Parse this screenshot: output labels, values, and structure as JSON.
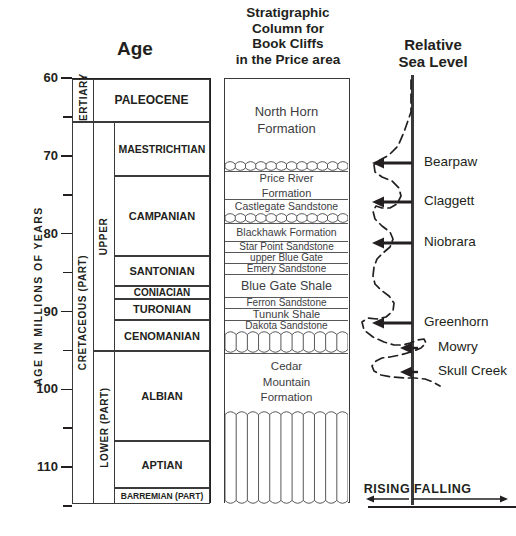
{
  "titles": {
    "age": "Age",
    "strat": [
      "Stratigraphic",
      "Column for",
      "Book Cliffs",
      "in the Price area"
    ],
    "sea": [
      "Relative",
      "Sea Level"
    ]
  },
  "axis": {
    "label": "AGE  IN  MILLIONS  OF  YEARS",
    "ticks": [
      {
        "value": "60",
        "major": true
      },
      {
        "value": "",
        "major": false
      },
      {
        "value": "70",
        "major": true
      },
      {
        "value": "",
        "major": false
      },
      {
        "value": "80",
        "major": true
      },
      {
        "value": "",
        "major": false
      },
      {
        "value": "90",
        "major": true
      },
      {
        "value": "",
        "major": false
      },
      {
        "value": "100",
        "major": true
      },
      {
        "value": "",
        "major": false
      },
      {
        "value": "110",
        "major": true
      },
      {
        "value": "",
        "major": false
      }
    ],
    "range": [
      60,
      115
    ]
  },
  "age_column": {
    "systems": [
      {
        "name": "TERTIARY",
        "top": 60,
        "bottom": 65.5
      },
      {
        "name": "CRETACEOUS  (PART)",
        "top": 65.5,
        "bottom": 114.6
      }
    ],
    "series": [
      {
        "name": "UPPER",
        "top": 65.5,
        "bottom": 95.0
      },
      {
        "name": "LOWER (PART)",
        "top": 95.0,
        "bottom": 114.6
      }
    ],
    "stages": [
      {
        "name": "PALEOCENE",
        "top": 60,
        "bottom": 65.5,
        "size": 12
      },
      {
        "name": "MAESTRICHTIAN",
        "top": 65.5,
        "bottom": 72.5,
        "size": 10.5
      },
      {
        "name": "CAMPANIAN",
        "top": 72.5,
        "bottom": 82.8,
        "size": 11
      },
      {
        "name": "SANTONIAN",
        "top": 82.8,
        "bottom": 86.6,
        "size": 11
      },
      {
        "name": "CONIACIAN",
        "top": 86.6,
        "bottom": 88.2,
        "size": 10
      },
      {
        "name": "TURONIAN",
        "top": 88.2,
        "bottom": 91.0,
        "size": 11
      },
      {
        "name": "CENOMANIAN",
        "top": 91.0,
        "bottom": 95.0,
        "size": 11
      },
      {
        "name": "ALBIAN",
        "top": 95.0,
        "bottom": 106.5,
        "size": 11
      },
      {
        "name": "APTIAN",
        "top": 106.5,
        "bottom": 112.6,
        "size": 11
      },
      {
        "name": "BARREMIAN (PART)",
        "top": 112.6,
        "bottom": 114.6,
        "size": 8.5
      }
    ]
  },
  "strat_column": {
    "units": [
      {
        "name": "North Horn Formation",
        "lines": [
          "North Horn",
          "Formation"
        ],
        "top": 78,
        "bottom": 160,
        "size": 13,
        "pattern": "plain"
      },
      {
        "name": "unconformity-1",
        "lines": [],
        "top": 160,
        "bottom": 170,
        "size": 0,
        "pattern": "wavy"
      },
      {
        "name": "Price River Formation",
        "lines": [
          "Price River",
          "Formation"
        ],
        "top": 170,
        "bottom": 198,
        "size": 11,
        "pattern": "plain"
      },
      {
        "name": "Castlegate Sandstone",
        "lines": [
          "Castlegate Sandstone"
        ],
        "top": 198,
        "bottom": 212,
        "size": 10.5,
        "pattern": "plain"
      },
      {
        "name": "unconformity-2",
        "lines": [],
        "top": 212,
        "bottom": 222,
        "size": 0,
        "pattern": "wavy"
      },
      {
        "name": "Blackhawk Formation",
        "lines": [
          "Blackhawk Formation"
        ],
        "top": 222,
        "bottom": 240,
        "size": 10.5,
        "pattern": "plain"
      },
      {
        "name": "Star Point Sandstone",
        "lines": [
          "Star Point Sandstone"
        ],
        "top": 240,
        "bottom": 251,
        "size": 10,
        "pattern": "plain"
      },
      {
        "name": "upper Blue Gate",
        "lines": [
          "upper Blue Gate"
        ],
        "top": 251,
        "bottom": 262,
        "size": 10,
        "pattern": "plain"
      },
      {
        "name": "Emery Sandstone",
        "lines": [
          "Emery Sandstone"
        ],
        "top": 262,
        "bottom": 273,
        "size": 10,
        "pattern": "plain"
      },
      {
        "name": "Blue Gate Shale",
        "lines": [
          "Blue Gate Shale"
        ],
        "top": 273,
        "bottom": 296,
        "size": 12.5,
        "pattern": "plain"
      },
      {
        "name": "Ferron Sandstone",
        "lines": [
          "Ferron Sandstone"
        ],
        "top": 296,
        "bottom": 307,
        "size": 10,
        "pattern": "plain"
      },
      {
        "name": "Tununk Shale",
        "lines": [
          "Tununk Shale"
        ],
        "top": 307,
        "bottom": 319,
        "size": 11,
        "pattern": "plain"
      },
      {
        "name": "Dakota Sandstone",
        "lines": [
          "Dakota Sandstone"
        ],
        "top": 319,
        "bottom": 330,
        "size": 10,
        "pattern": "plain"
      },
      {
        "name": "unconformity-3",
        "lines": [],
        "top": 330,
        "bottom": 352,
        "size": 0,
        "pattern": "columnar"
      },
      {
        "name": "Cedar Mountain Formation",
        "lines": [
          "Cedar",
          "Mountain",
          "Formation"
        ],
        "top": 352,
        "bottom": 410,
        "size": 11.5,
        "pattern": "plain"
      },
      {
        "name": "unconformity-4",
        "lines": [],
        "top": 410,
        "bottom": 503,
        "size": 0,
        "pattern": "columnar"
      }
    ]
  },
  "sea_level": {
    "events": [
      {
        "label": "Bearpaw",
        "y": 163
      },
      {
        "label": "Claggett",
        "y": 202
      },
      {
        "label": "Niobrara",
        "y": 243
      },
      {
        "label": "Greenhorn",
        "y": 323
      },
      {
        "label": "Mowry",
        "y": 348
      },
      {
        "label": "Skull Creek",
        "y": 372
      }
    ],
    "rising_label": "RISING",
    "falling_label": "FALLING",
    "curve_points": "411,80 411,112 404,132 398,146 389,155 380,160 374,165 375,172 382,177 392,181 399,188 401,196 397,204 390,208 382,208 376,206 373,211 375,219 382,226 390,232 393,239 390,247 383,253 377,259 374,267 373,276 375,284 381,290 389,296 394,303 393,311 386,317 377,319 368,318 362,322 364,330 373,337 384,342 394,345 403,345 410,343 418,340 424,339 426,343 421,348 411,352 400,355 390,357 382,358 376,361 372,366 374,371 381,375 392,377 404,378 415,378 425,379 433,382 440,386"
  },
  "colors": {
    "ink": "#231f20",
    "line": "#58585b",
    "unit_text": "#3d3d3f"
  }
}
